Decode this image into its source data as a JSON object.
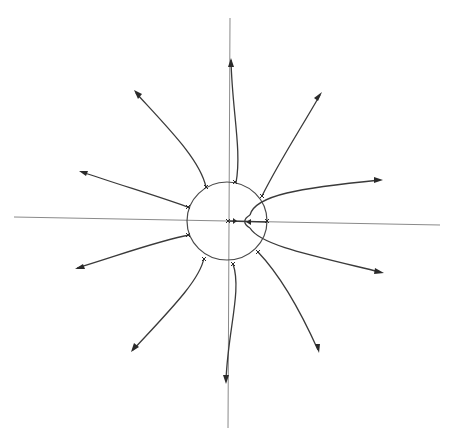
{
  "figure": {
    "type": "root-locus-diagram",
    "colors": {
      "axes": "#8a8a8a",
      "locus": "#3a3a3a",
      "background": "#ffffff"
    },
    "axes": {
      "real_axis_label": "",
      "imag_axis_label": ""
    },
    "pole_count_on_circle": 12,
    "poles_on_real_axis": 2,
    "branch_count": 12,
    "branch_directions": [
      "90°",
      "60°",
      "30°",
      "0°-ish (upper right)",
      "-30°",
      "-60°",
      "-90°",
      "-120°",
      "-150°",
      "150°",
      "120°",
      "real-axis segment"
    ]
  }
}
